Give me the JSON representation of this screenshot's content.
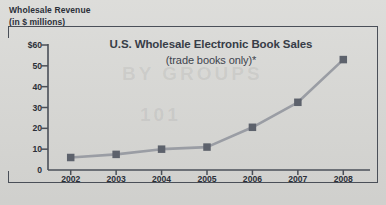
{
  "axis_title": {
    "line1": "Wholesale Revenue",
    "line2": "(in $ millions)"
  },
  "colors": {
    "background": "#d9d9d6",
    "axis": "#4a4f58",
    "text": "#2b2f38",
    "series_line": "#9a9da4",
    "series_marker": "#5d626c"
  },
  "chart_data": {
    "type": "line",
    "title": "U.S. Wholesale Electronic Book Sales",
    "subtitle": "(trade books only)*",
    "xlabel": "",
    "ylabel": "Wholesale Revenue (in $ millions)",
    "categories": [
      "2002",
      "2003",
      "2004",
      "2005",
      "2006",
      "2007",
      "2008"
    ],
    "values": [
      6,
      7.5,
      10,
      11,
      20.5,
      32.5,
      53
    ],
    "series": [
      {
        "name": "U.S. Wholesale Electronic Book Sales",
        "values": [
          6,
          7.5,
          10,
          11,
          20.5,
          32.5,
          53
        ]
      }
    ],
    "ylim": [
      0,
      60
    ],
    "ytick_labels": [
      "$60",
      "50",
      "40",
      "30",
      "20",
      "10",
      "0"
    ],
    "ytick_values": [
      60,
      50,
      40,
      30,
      20,
      10,
      0
    ],
    "xtick_labels": [
      "2002",
      "2003",
      "2004",
      "2005",
      "2006",
      "2007",
      "2008"
    ],
    "grid": false,
    "legend": false,
    "marker": "square",
    "annotations": [
      "*"
    ]
  }
}
